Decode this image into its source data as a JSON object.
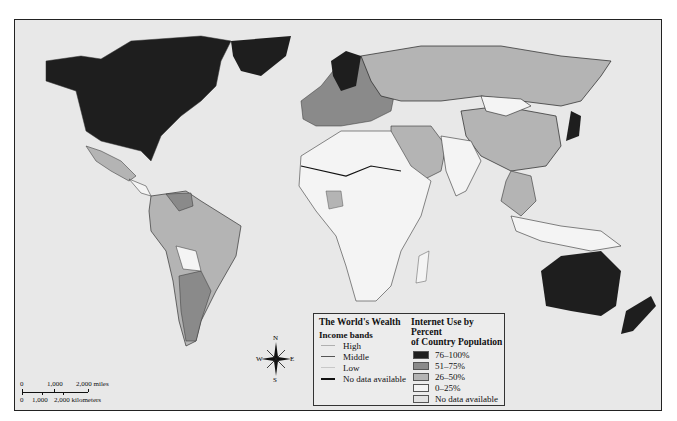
{
  "legend": {
    "title": "The World's Wealth",
    "income_heading": "Income bands",
    "income_bands": [
      {
        "label": "High",
        "color": "#b0b0b0",
        "width": 1
      },
      {
        "label": "Middle",
        "color": "#555555",
        "width": 1
      },
      {
        "label": "Low",
        "color": "#c8c8c8",
        "width": 1
      },
      {
        "label": "No data available",
        "color": "#111111",
        "width": 2
      }
    ],
    "internet_title_line1": "Internet Use by Percent",
    "internet_title_line2": "of Country Population",
    "internet_bands": [
      {
        "label": "76–100%",
        "color": "#1e1e1e"
      },
      {
        "label": "51–75%",
        "color": "#8a8a8a"
      },
      {
        "label": "26–50%",
        "color": "#b4b4b4"
      },
      {
        "label": "0–25%",
        "color": "#f4f4f4"
      },
      {
        "label": "No data available",
        "color": "#e2e2e2"
      }
    ]
  },
  "scale_bar": {
    "miles": {
      "labels": [
        "0",
        "1,000",
        "2,000 miles"
      ]
    },
    "kilometers": {
      "labels": [
        "0",
        "1,000",
        "2,000 kilometers"
      ]
    }
  },
  "compass": {
    "n": "N",
    "s": "S",
    "e": "E",
    "w": "W"
  },
  "colors": {
    "ocean": "#e8e8e8",
    "high": "#1e1e1e",
    "mid_high": "#8a8a8a",
    "mid": "#b4b4b4",
    "low": "#f4f4f4"
  }
}
